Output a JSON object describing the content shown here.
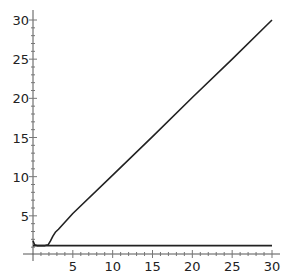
{
  "chart_data": {
    "type": "line",
    "title": "",
    "xlabel": "",
    "ylabel": "",
    "xlim": [
      0,
      30
    ],
    "ylim": [
      0,
      30
    ],
    "grid": false,
    "legend": null,
    "x_ticks": [
      "5",
      "10",
      "15",
      "20",
      "25",
      "30"
    ],
    "y_ticks": [
      "5",
      "10",
      "15",
      "20",
      "25",
      "30"
    ],
    "series": [
      {
        "name": "curve",
        "x": [
          0,
          0.2,
          0.5,
          1.0,
          1.5,
          1.9,
          2.2,
          2.5,
          2.8,
          3.2,
          5,
          10,
          15,
          20,
          25,
          30
        ],
        "y": [
          1.8,
          1.3,
          1.2,
          1.2,
          1.2,
          1.3,
          1.8,
          2.4,
          2.9,
          3.3,
          5.3,
          10.2,
          15.1,
          20.1,
          25.0,
          30.0
        ]
      },
      {
        "name": "flat",
        "x": [
          0,
          30
        ],
        "y": [
          1.2,
          1.2
        ]
      }
    ]
  }
}
